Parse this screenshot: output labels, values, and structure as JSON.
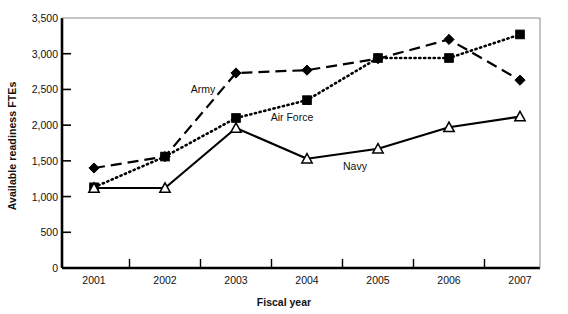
{
  "chart_data": {
    "type": "line",
    "title": "",
    "xlabel": "Fiscal year",
    "ylabel": "Available readiness FTEs",
    "categories": [
      "2001",
      "2002",
      "2003",
      "2004",
      "2005",
      "2006",
      "2007"
    ],
    "ylim": [
      0,
      3500
    ],
    "yticks": [
      "0",
      "500",
      "1,000",
      "1,500",
      "2,000",
      "2,500",
      "3,000",
      "3,500"
    ],
    "ytick_values": [
      0,
      500,
      1000,
      1500,
      2000,
      2500,
      3000,
      3500
    ],
    "grid": false,
    "legend_position": "inline-annotations",
    "series": [
      {
        "name": "Army",
        "marker": "diamond",
        "linestyle": "dashed",
        "color": "#000000",
        "values": [
          1400,
          1560,
          2730,
          2770,
          2930,
          3200,
          2630
        ]
      },
      {
        "name": "Air Force",
        "marker": "square",
        "linestyle": "dotted",
        "color": "#000000",
        "values": [
          1130,
          1560,
          2100,
          2350,
          2940,
          2940,
          3270
        ]
      },
      {
        "name": "Navy",
        "marker": "triangle",
        "linestyle": "solid",
        "color": "#000000",
        "values": [
          1120,
          1120,
          1960,
          1530,
          1670,
          1970,
          2120
        ]
      }
    ],
    "annotations": [
      {
        "text": "Army",
        "series": "Army",
        "x_px": 203,
        "y_px": 89
      },
      {
        "text": "Air Force",
        "series": "Air Force",
        "x_px": 292,
        "y_px": 117
      },
      {
        "text": "Navy",
        "series": "Navy",
        "x_px": 355,
        "y_px": 166
      }
    ]
  }
}
